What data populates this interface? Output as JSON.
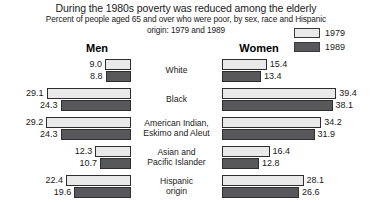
{
  "header": {
    "title": "During the 1980s poverty was reduced among the elderly",
    "subtitle": "Percent of people aged 65 and over who were poor, by sex, race and Hispanic origin: 1979 and 1989"
  },
  "legend": {
    "items": [
      {
        "label": "1979",
        "color": "#e9e9e9",
        "swatch_name": "legend-swatch-1979"
      },
      {
        "label": "1989",
        "color": "#58585a",
        "swatch_name": "legend-swatch-1989"
      }
    ]
  },
  "columns": {
    "men": "Men",
    "women": "Women"
  },
  "chart_data": {
    "type": "bar",
    "title": "During the 1980s poverty was reduced among the elderly",
    "subtitle": "Percent of people aged 65 and over who were poor, by sex, race and Hispanic origin: 1979 and 1989",
    "xlabel": "",
    "ylabel": "",
    "orientation": "horizontal-diverging",
    "grid": false,
    "legend_position": "top-right",
    "categories": [
      "White",
      "Black",
      "American Indian, Eskimo and Aleut",
      "Asian and Pacific Islander",
      "Hispanic origin"
    ],
    "category_lines": [
      [
        "White"
      ],
      [
        "Black"
      ],
      [
        "American Indian,",
        "Eskimo and Aleut"
      ],
      [
        "Asian and",
        "Pacific Islander"
      ],
      [
        "Hispanic",
        "origin"
      ]
    ],
    "groups": [
      "Men",
      "Women"
    ],
    "series": [
      {
        "name": "Men 1979",
        "group": "Men",
        "year": "1979",
        "color": "#e9e9e9",
        "values": [
          9.0,
          29.1,
          29.2,
          12.3,
          22.4
        ]
      },
      {
        "name": "Men 1989",
        "group": "Men",
        "year": "1989",
        "color": "#58585a",
        "values": [
          8.8,
          24.3,
          24.3,
          10.7,
          19.6
        ]
      },
      {
        "name": "Women 1979",
        "group": "Women",
        "year": "1979",
        "color": "#e9e9e9",
        "values": [
          15.4,
          39.4,
          34.2,
          16.4,
          28.1
        ]
      },
      {
        "name": "Women 1989",
        "group": "Women",
        "year": "1989",
        "color": "#58585a",
        "values": [
          13.4,
          38.1,
          31.9,
          12.8,
          26.6
        ]
      }
    ],
    "value_labels": {
      "men_1979": [
        "9.0",
        "29.1",
        "29.2",
        "12.3",
        "22.4"
      ],
      "men_1989": [
        "8.8",
        "24.3",
        "24.3",
        "10.7",
        "19.6"
      ],
      "women_1979": [
        "15.4",
        "39.4",
        "34.2",
        "16.4",
        "28.1"
      ],
      "women_1989": [
        "13.4",
        "38.1",
        "31.9",
        "12.8",
        "26.6"
      ]
    },
    "xlim": [
      0,
      40
    ],
    "px_per_unit": 2.9
  }
}
